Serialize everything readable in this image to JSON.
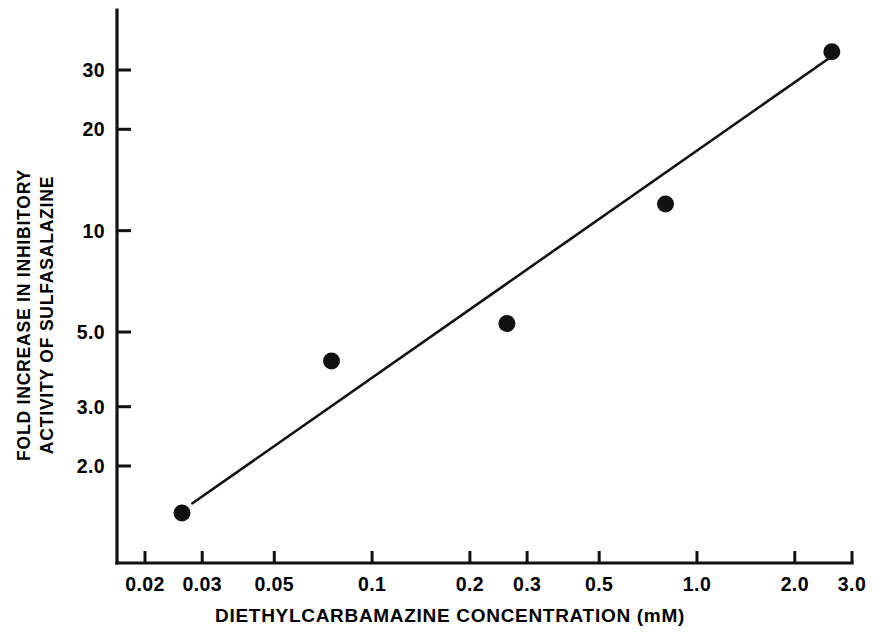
{
  "chart_data": {
    "type": "scatter",
    "title": "",
    "xlabel": "DIETHYLCARBAMAZINE CONCENTRATION (mM)",
    "ylabel_line1": "FOLD INCREASE IN INHIBITORY",
    "ylabel_line2": "ACTIVITY OF SULFASALAZINE",
    "xscale": "log",
    "yscale": "log",
    "xlim": [
      0.02,
      3.0
    ],
    "ylim": [
      1.3,
      40
    ],
    "grid": false,
    "legend": null,
    "xticks": [
      0.02,
      0.03,
      0.05,
      0.1,
      0.2,
      0.3,
      0.5,
      1.0,
      2.0,
      3.0
    ],
    "xtick_labels": [
      "0.02",
      "0.03",
      "0.05",
      "0.1",
      "0.2",
      "0.3",
      "0.5",
      "1.0",
      "2.0",
      "3.0"
    ],
    "yticks": [
      2.0,
      3.0,
      5.0,
      10,
      20,
      30
    ],
    "ytick_labels": [
      "2.0",
      "3.0",
      "5.0",
      "10",
      "20",
      "30"
    ],
    "series": [
      {
        "name": "observed",
        "marker": "filled-circle",
        "color": "#111111",
        "points": [
          {
            "x": 0.026,
            "y": 1.45
          },
          {
            "x": 0.075,
            "y": 4.1
          },
          {
            "x": 0.26,
            "y": 5.3
          },
          {
            "x": 0.8,
            "y": 12.0
          },
          {
            "x": 2.6,
            "y": 34.0
          }
        ]
      },
      {
        "name": "regression-line",
        "type": "line",
        "color": "#111111",
        "endpoints": [
          {
            "x": 0.028,
            "y": 1.55
          },
          {
            "x": 2.55,
            "y": 32.5
          }
        ]
      }
    ]
  },
  "axes": {
    "x_axis_name": "x-axis",
    "y_axis_name": "y-axis"
  }
}
